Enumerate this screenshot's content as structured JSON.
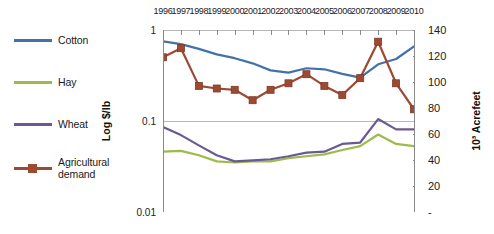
{
  "chart_data": {
    "type": "line",
    "title": "",
    "xlabel": "",
    "ylabel": "Log $/lb",
    "ylabel_right": "10³ Acrefeet",
    "x_axis_position": "top",
    "y_left_scale": "log",
    "y_left_ticks": [
      "1",
      "0.1",
      "0.01"
    ],
    "y_left_tick_values": [
      1,
      0.1,
      0.01
    ],
    "ylim_left": [
      0.01,
      1
    ],
    "y_right_ticks": [
      "140",
      "120",
      "100",
      "80",
      "60",
      "40",
      "20",
      "-"
    ],
    "y_right_tick_values": [
      140,
      120,
      100,
      80,
      60,
      40,
      20,
      0
    ],
    "ylim_right": [
      0,
      140
    ],
    "grid": true,
    "legend_position": "left",
    "categories": [
      "1996",
      "1997",
      "1998",
      "1999",
      "2000",
      "2001",
      "2002",
      "2003",
      "2004",
      "2005",
      "2006",
      "2007",
      "2008",
      "2009",
      "2010"
    ],
    "series": [
      {
        "name": "Cotton",
        "color": "#4472a8",
        "axis": "left",
        "units": "$/lb",
        "marker": "none",
        "values": [
          0.75,
          0.7,
          0.62,
          0.54,
          0.49,
          0.43,
          0.36,
          0.34,
          0.38,
          0.37,
          0.33,
          0.3,
          0.42,
          0.48,
          0.66
        ]
      },
      {
        "name": "Hay",
        "color": "#9dbb4b",
        "axis": "left",
        "units": "$/lb",
        "marker": "none",
        "values": [
          0.046,
          0.047,
          0.042,
          0.036,
          0.035,
          0.036,
          0.036,
          0.039,
          0.041,
          0.043,
          0.048,
          0.053,
          0.071,
          0.056,
          0.053
        ]
      },
      {
        "name": "Wheat",
        "color": "#6a5a93",
        "axis": "left",
        "units": "$/lb",
        "marker": "none",
        "values": [
          0.086,
          0.07,
          0.054,
          0.042,
          0.036,
          0.037,
          0.038,
          0.041,
          0.045,
          0.046,
          0.056,
          0.058,
          0.105,
          0.081,
          0.081
        ]
      },
      {
        "name": "Agricultural demand",
        "color": "#9e4a33",
        "axis": "right",
        "units": "10³ Acrefeet",
        "marker": "square",
        "values": [
          119,
          126,
          97,
          95,
          94,
          86,
          94,
          99,
          106,
          97,
          90,
          103,
          131,
          99,
          79
        ]
      }
    ]
  },
  "legend": {
    "items": [
      {
        "label": "Cotton",
        "color": "#4472a8",
        "marker": "none"
      },
      {
        "label": "Hay",
        "color": "#9dbb4b",
        "marker": "none"
      },
      {
        "label": "Wheat",
        "color": "#6a5a93",
        "marker": "none"
      },
      {
        "label": "Agricultural demand",
        "color": "#9e4a33",
        "marker": "square"
      }
    ]
  },
  "colors": {
    "cotton": "#4472a8",
    "hay": "#9dbb4b",
    "wheat": "#6a5a93",
    "agricultural_demand": "#9e4a33",
    "gridline": "#b7b7b7",
    "axis": "#8a8a8a",
    "background": "#ffffff"
  }
}
